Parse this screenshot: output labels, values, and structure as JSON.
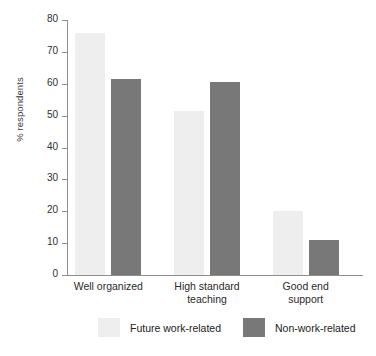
{
  "chart_data": {
    "type": "bar",
    "title": "",
    "xlabel": "",
    "ylabel": "% respondents",
    "ylim": [
      0,
      80
    ],
    "yticks": [
      0,
      10,
      20,
      30,
      40,
      50,
      60,
      70,
      80
    ],
    "grid": false,
    "legend_position": "bottom",
    "categories": [
      "Well organized",
      "High standard\nteaching",
      "Good end\nsupport"
    ],
    "series": [
      {
        "name": "Future work-related",
        "color": "#eeeeee",
        "values": [
          76,
          51.5,
          20
        ]
      },
      {
        "name": "Non-work-related",
        "color": "#787878",
        "values": [
          61.5,
          60.5,
          11
        ]
      }
    ]
  },
  "axis": {
    "y_title": "% respondents",
    "tick_labels": [
      "80",
      "70",
      "60",
      "50",
      "40",
      "30",
      "20",
      "10",
      "0"
    ]
  },
  "legend": {
    "items": [
      {
        "label": "Future work-related",
        "swatch": "light"
      },
      {
        "label": "Non-work-related",
        "swatch": "dark"
      }
    ]
  },
  "colors": {
    "light_bar": "#eeeeee",
    "dark_bar": "#787878",
    "axis": "#8e8e8e",
    "text": "#222222",
    "background": "#ffffff"
  }
}
